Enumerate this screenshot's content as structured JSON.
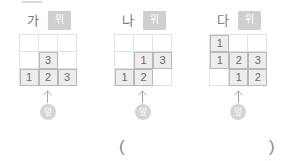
{
  "figure": {
    "top_badge_label": "위",
    "front_badge_label": "앞",
    "arrow_icon": "up-arrow-icon",
    "panels": [
      {
        "letter": "가",
        "grid": [
          [
            "",
            "",
            ""
          ],
          [
            "",
            "3",
            ""
          ],
          [
            "1",
            "2",
            "3"
          ]
        ]
      },
      {
        "letter": "나",
        "grid": [
          [
            "",
            "",
            ""
          ],
          [
            "",
            "1",
            "3"
          ],
          [
            "1",
            "2",
            ""
          ]
        ]
      },
      {
        "letter": "다",
        "grid": [
          [
            "1",
            "",
            ""
          ],
          [
            "1",
            "2",
            "3"
          ],
          [
            "",
            "1",
            "2"
          ]
        ]
      }
    ]
  },
  "answer": {
    "open_paren": "(",
    "close_paren": ")",
    "value": ""
  },
  "colors": {
    "cell_fill": "#ededed",
    "cell_border": "#b9b9b9",
    "grid_line": "#e2e2e2",
    "badge_bg": "#cfcfcf",
    "text": "#7b7b7b"
  }
}
